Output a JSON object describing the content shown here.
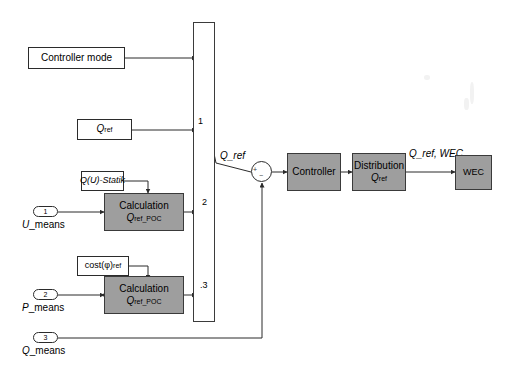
{
  "diagram": {
    "canvas": {
      "width": 516,
      "height": 365,
      "background": "#ffffff"
    },
    "colors": {
      "shaded_block": "#9e9e9e",
      "line": "#2b2b2b",
      "background": "#ffffff"
    }
  },
  "blocks": {
    "controller_mode": {
      "label": "Controller mode"
    },
    "q_ref_source": {
      "label": "Q",
      "sub": "ref"
    },
    "qu_statik": {
      "label": "Q(U)-Statik"
    },
    "cost_phi_ref": {
      "label": "cost(φ)",
      "sub": "ref"
    },
    "calculation_1": {
      "line1": "Calculation",
      "line2": "Q",
      "line2_sub": "ref_POC"
    },
    "calculation_2": {
      "line1": "Calculation",
      "line2": "Q",
      "line2_sub": "ref_POC"
    },
    "controller": {
      "label": "Controller"
    },
    "distribution": {
      "line1": "Distribution",
      "line2": "Q",
      "line2_sub": "ref"
    },
    "wec": {
      "label": "WEC"
    }
  },
  "switch_block": {
    "name": "multiport-switch",
    "port_labels": [
      "1",
      "2",
      ".3"
    ],
    "control_port_label": ""
  },
  "input_ports": [
    {
      "number": "1",
      "label": "U",
      "label_rest": "_means"
    },
    {
      "number": "2",
      "label": "P",
      "label_rest": "_means"
    },
    {
      "number": "3",
      "label": "Q",
      "label_rest": "_means"
    }
  ],
  "signal_labels": {
    "q_ref_out": "Q_ref",
    "q_ref_wec": "Q_ref, WEC"
  },
  "sum_junction": {
    "name": "summing-junction",
    "plus": "+",
    "minus": "−"
  }
}
